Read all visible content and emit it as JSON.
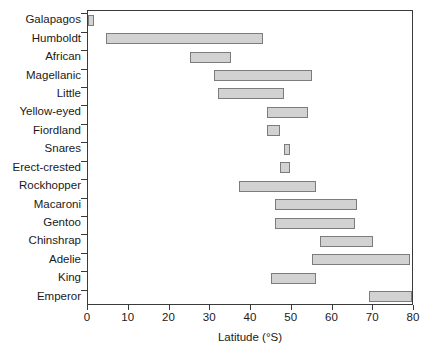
{
  "chart_data": {
    "type": "bar",
    "orientation": "horizontal",
    "subtype": "range-bar",
    "title": "",
    "xlabel": "Latitude (°S)",
    "ylabel": "",
    "xlim": [
      0,
      80
    ],
    "xticks": [
      0,
      10,
      20,
      30,
      40,
      50,
      60,
      70,
      80
    ],
    "xtick_labels": [
      "0",
      "10",
      "20",
      "30",
      "40",
      "50",
      "60",
      "70",
      "80"
    ],
    "grid": false,
    "legend": false,
    "bar_fill_color": "#d2d2d2",
    "bar_edge_color": "#7c7c7c",
    "axis_color": "#3a3a3a",
    "categories": [
      "Galapagos",
      "Humboldt",
      "African",
      "Magellanic",
      "Little",
      "Yellow-eyed",
      "Fiordland",
      "Snares",
      "Erect-crested",
      "Rockhopper",
      "Macaroni",
      "Gentoo",
      "Chinshrap",
      "Adelie",
      "King",
      "Emperor"
    ],
    "ranges": [
      {
        "category": "Galapagos",
        "start": 0,
        "end": 1.5
      },
      {
        "category": "Humboldt",
        "start": 4.5,
        "end": 43
      },
      {
        "category": "African",
        "start": 25,
        "end": 35
      },
      {
        "category": "Magellanic",
        "start": 31,
        "end": 55
      },
      {
        "category": "Little",
        "start": 32,
        "end": 48
      },
      {
        "category": "Yellow-eyed",
        "start": 44,
        "end": 54
      },
      {
        "category": "Fiordland",
        "start": 44,
        "end": 47
      },
      {
        "category": "Snares",
        "start": 48,
        "end": 49.5
      },
      {
        "category": "Erect-crested",
        "start": 47,
        "end": 49.5
      },
      {
        "category": "Rockhopper",
        "start": 37,
        "end": 56
      },
      {
        "category": "Macaroni",
        "start": 46,
        "end": 66
      },
      {
        "category": "Gentoo",
        "start": 46,
        "end": 65.5
      },
      {
        "category": "Chinshrap",
        "start": 57,
        "end": 70
      },
      {
        "category": "Adelie",
        "start": 55,
        "end": 79
      },
      {
        "category": "King",
        "start": 45,
        "end": 56
      },
      {
        "category": "Emperor",
        "start": 69,
        "end": 79.5
      }
    ]
  }
}
